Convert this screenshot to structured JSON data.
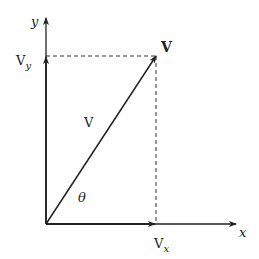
{
  "diagram": {
    "type": "vector-components",
    "colors": {
      "stroke": "#222222",
      "background": "#ffffff"
    },
    "labels": {
      "y_axis": "y",
      "x_axis": "x",
      "vy_main": "V",
      "vy_sub": "y",
      "vx_main": "V",
      "vx_sub": "x",
      "vector_bold": "V",
      "vector_magnitude": "V",
      "angle": "θ"
    },
    "elements": [
      {
        "id": "y-axis",
        "kind": "arrow",
        "from": [
          46,
          224
        ],
        "to": [
          46,
          18
        ]
      },
      {
        "id": "x-axis",
        "kind": "arrow",
        "from": [
          46,
          224
        ],
        "to": [
          236,
          224
        ]
      },
      {
        "id": "vy-component",
        "kind": "arrow",
        "from": [
          46,
          224
        ],
        "to": [
          46,
          56
        ]
      },
      {
        "id": "vx-component",
        "kind": "arrow",
        "from": [
          46,
          224
        ],
        "to": [
          156,
          224
        ]
      },
      {
        "id": "vector-v",
        "kind": "arrow",
        "from": [
          46,
          224
        ],
        "to": [
          156,
          56
        ]
      },
      {
        "id": "dashed-horizontal",
        "kind": "dashed-line",
        "from": [
          46,
          56
        ],
        "to": [
          156,
          56
        ]
      },
      {
        "id": "dashed-vertical",
        "kind": "dashed-line",
        "from": [
          156,
          56
        ],
        "to": [
          156,
          224
        ]
      }
    ]
  }
}
